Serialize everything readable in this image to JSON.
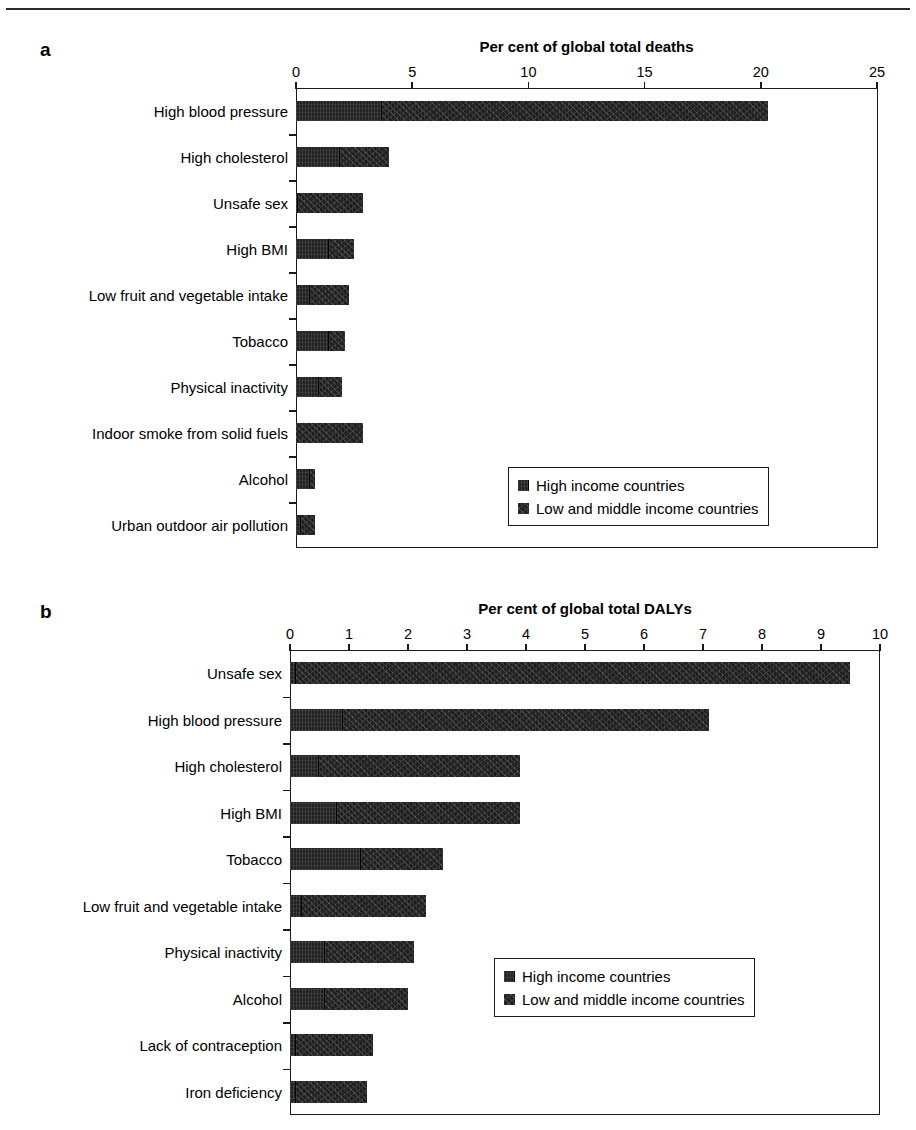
{
  "figure": {
    "panels": [
      {
        "letter": "a",
        "axis_title": "Per cent of global total deaths",
        "tick_labels": [
          "0",
          "5",
          "10",
          "15",
          "20",
          "25"
        ],
        "legend": {
          "items": [
            {
              "label": "High income countries",
              "swatch": "legend-swatch-high-income"
            },
            {
              "label": "Low and middle income countries",
              "swatch": "legend-swatch-low-middle-income"
            }
          ]
        }
      },
      {
        "letter": "b",
        "axis_title": "Per cent of global total DALYs",
        "tick_labels": [
          "0",
          "1",
          "2",
          "3",
          "4",
          "5",
          "6",
          "7",
          "8",
          "9",
          "10"
        ],
        "legend": {
          "items": [
            {
              "label": "High income countries",
              "swatch": "legend-swatch-high-income"
            },
            {
              "label": "Low and middle income countries",
              "swatch": "legend-swatch-low-middle-income"
            }
          ]
        }
      }
    ]
  },
  "colors": {
    "high_income": "#232323",
    "low_middle_income": "#1d1d1d",
    "axis": "#1a1a1a",
    "background": "#ffffff"
  },
  "chart_data": [
    {
      "type": "bar",
      "orientation": "horizontal",
      "stacked": true,
      "panel": "a",
      "title": "Per cent of global total deaths",
      "xlabel": "Per cent of global total deaths",
      "ylabel": "",
      "xlim": [
        0,
        25
      ],
      "xticks": [
        0,
        5,
        10,
        15,
        20,
        25
      ],
      "grid": false,
      "legend_position": "inside-lower-right",
      "categories": [
        "High blood pressure",
        "High cholesterol",
        "Unsafe sex",
        "High BMI",
        "Low fruit and vegetable intake",
        "Tobacco",
        "Physical inactivity",
        "Indoor smoke from solid fuels",
        "Alcohol",
        "Urban outdoor air pollution"
      ],
      "series": [
        {
          "name": "High income countries",
          "values": [
            3.7,
            1.9,
            0.1,
            1.4,
            0.6,
            1.4,
            1.0,
            0.0,
            0.6,
            0.2
          ]
        },
        {
          "name": "Low and middle income countries",
          "values": [
            16.6,
            2.1,
            2.8,
            1.1,
            1.7,
            0.7,
            1.0,
            2.9,
            0.2,
            0.6
          ]
        }
      ],
      "totals": [
        20.3,
        4.0,
        2.9,
        2.5,
        2.3,
        2.1,
        2.0,
        2.9,
        0.8,
        0.8
      ]
    },
    {
      "type": "bar",
      "orientation": "horizontal",
      "stacked": true,
      "panel": "b",
      "title": "Per cent of global total DALYs",
      "xlabel": "Per cent of global total DALYs",
      "ylabel": "",
      "xlim": [
        0,
        10
      ],
      "xticks": [
        0,
        1,
        2,
        3,
        4,
        5,
        6,
        7,
        8,
        9,
        10
      ],
      "grid": false,
      "legend_position": "inside-lower-right",
      "categories": [
        "Unsafe sex",
        "High blood pressure",
        "High cholesterol",
        "High BMI",
        "Tobacco",
        "Low fruit and vegetable intake",
        "Physical inactivity",
        "Alcohol",
        "Lack of contraception",
        "Iron deficiency"
      ],
      "series": [
        {
          "name": "High income countries",
          "values": [
            0.1,
            0.9,
            0.5,
            0.8,
            1.2,
            0.2,
            0.6,
            0.6,
            0.1,
            0.1
          ]
        },
        {
          "name": "Low and middle income countries",
          "values": [
            9.4,
            6.2,
            3.4,
            3.1,
            1.4,
            2.1,
            1.5,
            1.4,
            1.3,
            1.2
          ]
        }
      ],
      "totals": [
        9.5,
        7.1,
        3.9,
        3.9,
        2.6,
        2.3,
        2.1,
        2.0,
        1.4,
        1.3
      ]
    }
  ]
}
